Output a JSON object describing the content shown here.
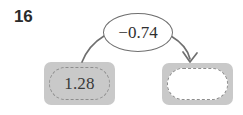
{
  "exercise": {
    "number": "16",
    "type": "function-machine-diagram"
  },
  "diagram": {
    "start_term": {
      "value": "1.28",
      "state": "filled"
    },
    "operation": {
      "label": "−0.74",
      "sign": "−",
      "magnitude": "0.74"
    },
    "result_term": {
      "value": "",
      "state": "blank"
    },
    "flow": {
      "source_icon": "curve-from-start-icon",
      "target_icon": "arrow-to-result-icon",
      "direction": "left-to-right"
    }
  },
  "colors": {
    "box_fill": "#c9c9c9",
    "dashed_border": "#8d8d8d",
    "bubble_border": "#6f6f6f",
    "connector": "#6f6f6f",
    "text": "#2f2f2f",
    "number_text": "#2b2b2b",
    "blank_fill": "#ffffff"
  }
}
